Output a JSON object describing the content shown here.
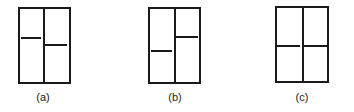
{
  "panels": [
    {
      "label": "(a)",
      "left_level_y": 38,
      "right_level_y": 45
    },
    {
      "label": "(b)",
      "left_level_y": 51,
      "right_level_y": 37
    },
    {
      "label": "(c)",
      "left_level_y": 46,
      "right_level_y": 46
    }
  ],
  "colors": {
    "line": "#1a1a1a",
    "background": "#ffffff"
  }
}
